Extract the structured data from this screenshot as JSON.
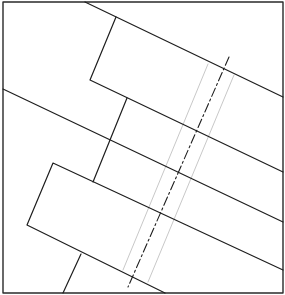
{
  "diagram": {
    "title": "",
    "colors": {
      "background": "#ffffff",
      "line": "#1e1e1e",
      "frame": "#2a2a2a",
      "faint": "#c8c8c8"
    },
    "frame": {
      "x": 3,
      "y": 2,
      "width": 280,
      "height": 291
    },
    "solid_polylines": [
      {
        "name": "top-band-edge",
        "points": "85,2 283,97"
      },
      {
        "name": "upper-block-outline",
        "points": "116,17 90,80 283,172"
      },
      {
        "name": "middle-band-edge",
        "points": "3,89 283,222"
      },
      {
        "name": "middle-connector",
        "points": "127,98 93,182"
      },
      {
        "name": "lower-block-outline",
        "points": "283,270 53,163 27,225 165,293"
      },
      {
        "name": "lower-connector",
        "points": "81,254 63,293"
      }
    ],
    "centerline": {
      "name": "dash-dot-axis",
      "x1": 229,
      "y1": 57,
      "x2": 128,
      "y2": 287
    },
    "faint_lines": [
      {
        "name": "faint-guide-left",
        "x1": 208,
        "y1": 64,
        "x2": 123,
        "y2": 270
      },
      {
        "name": "faint-guide-right",
        "x1": 234,
        "y1": 75,
        "x2": 148,
        "y2": 282
      }
    ]
  }
}
